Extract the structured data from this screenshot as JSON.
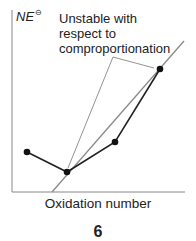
{
  "diagram": {
    "y_axis_label": "NE",
    "y_axis_label_sup": "⊖",
    "x_axis_label": "Oxidation number",
    "annotation": [
      "Unstable with",
      "respect to",
      "comproportionation"
    ],
    "figure_number": "6",
    "points": [
      {
        "x": 27,
        "y": 152
      },
      {
        "x": 67,
        "y": 172
      },
      {
        "x": 115,
        "y": 142
      },
      {
        "x": 160,
        "y": 69
      }
    ],
    "colors": {
      "axis": "#888888",
      "data_line": "#222222",
      "tie_line": "#8a8a8a",
      "callout": "#777777"
    }
  }
}
